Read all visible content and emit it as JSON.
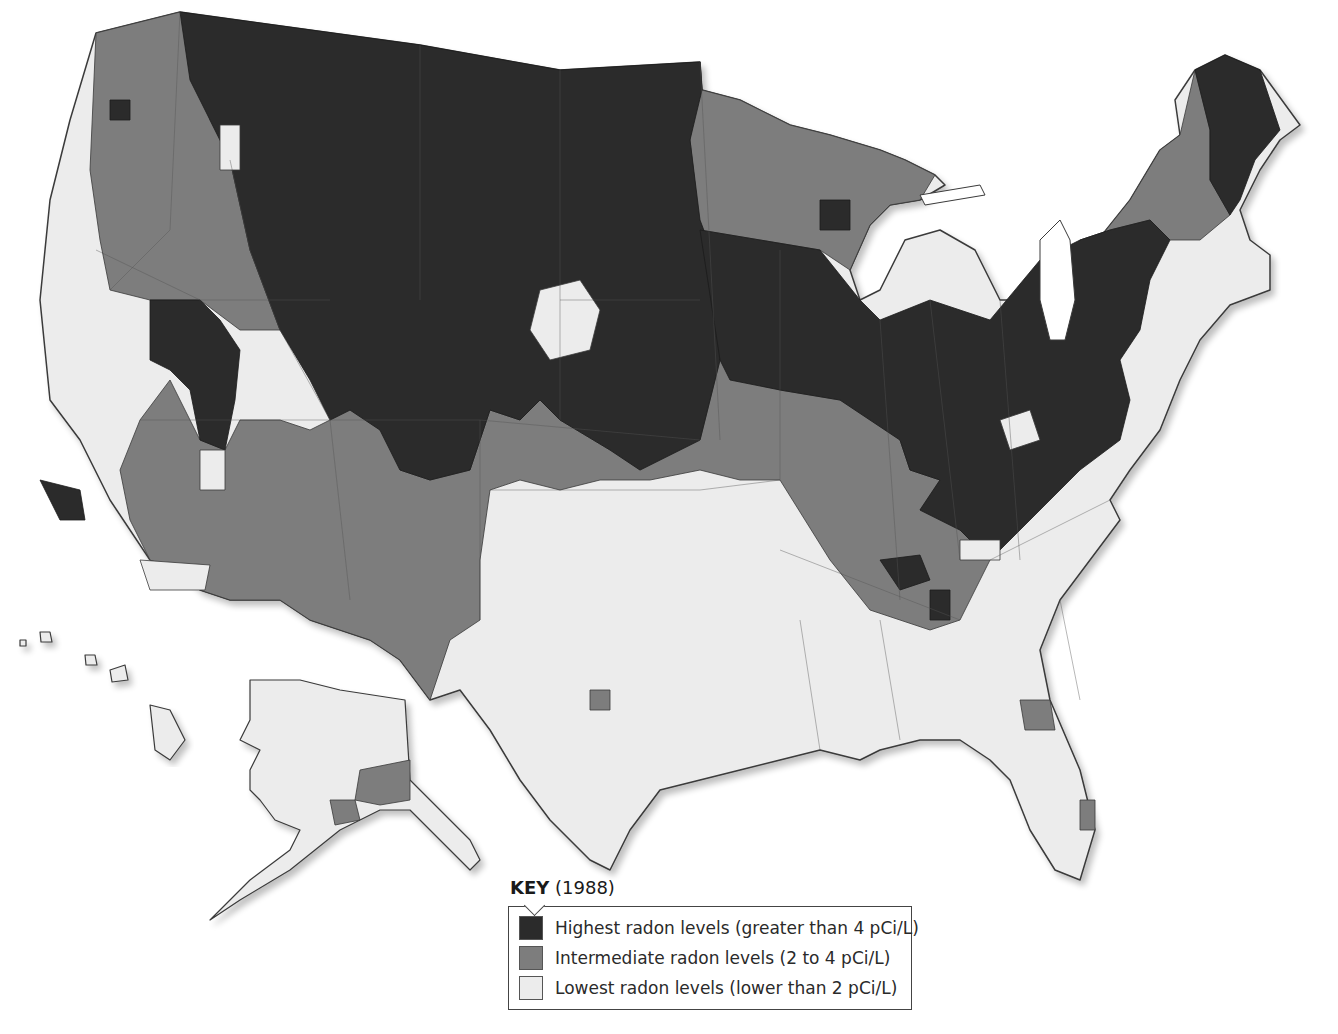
{
  "legend": {
    "title_bold": "KEY",
    "title_year": "(1988)",
    "items": [
      {
        "label": "Highest radon levels (greater than 4 pCi/L)",
        "color": "#2b2b2b"
      },
      {
        "label": "Intermediate radon levels (2 to 4 pCi/L)",
        "color": "#7d7d7d"
      },
      {
        "label": "Lowest radon levels (lower than 2 pCi/L)",
        "color": "#ececec"
      }
    ]
  },
  "colors": {
    "high": "#2b2b2b",
    "mid": "#7d7d7d",
    "low": "#ececec",
    "border": "#3a3a3a",
    "water": "#ffffff"
  },
  "map": {
    "regions": {
      "conus_outline": "96,33 180,12 420,45 560,70 700,62 702,90 740,100 790,125 830,135 880,150 905,160 935,175 945,185 920,200 890,205 870,225 850,270 860,300 880,290 905,240 940,230 975,250 1000,300 1020,300 1060,270 1090,250 1130,200 1160,150 1180,135 1175,100 1195,70 1225,55 1260,70 1300,125 1280,140 1260,170 1240,210 1250,240 1270,255 1270,290 1230,305 1200,340 1180,380 1160,430 1130,470 1110,500 1120,520 1090,560 1060,600 1040,650 1050,700 1080,770 1095,830 1080,880 1055,870 1030,830 1010,780 990,760 960,740 920,740 880,750 860,760 820,750 780,760 740,770 700,780 660,790 630,830 610,870 590,860 550,820 520,780 490,730 460,690 430,700 400,660 370,640 310,620 280,600 230,600 200,590 180,570 150,560 110,500 80,440 50,400 40,300 50,200 70,120",
      "high": [
        "180,12 420,45 560,70 700,62 702,90 690,140 700,220 730,300 720,360 700,440 640,470 610,450 560,420 540,400 520,420 490,410 470,470 430,480 400,470 380,430 350,410 330,420 310,380 280,330 250,250 230,160 210,120 190,80",
        "700,230 760,240 820,250 860,300 880,320 930,300 990,320 1040,260 1080,240 1110,230 1150,220 1170,240 1150,280 1140,330 1120,360 1130,400 1120,440 1080,470 1030,520 990,560 960,530 920,510 940,480 910,470 900,440 870,420 840,400 780,390 730,380 720,360",
        "1195,70 1225,55 1260,70 1280,130 1255,160 1240,200 1230,215 1210,180 1210,130",
        "150,300 200,300 220,320 240,350 235,400 225,450 200,440 190,390 170,370 150,360",
        "40,480 80,490 85,520 60,520",
        "880,560 920,555 930,580 900,590",
        "930,590 950,590 950,620 930,620",
        "110,100 130,100 130,120 110,120",
        "820,200 850,200 850,230 820,230"
      ],
      "mid": [
        "96,33 180,12 200,80 210,120 230,160 250,250 280,330 240,330 200,300 150,300 110,290 100,240 90,170",
        "330,420 350,410 380,430 400,470 430,480 470,470 490,410 520,420 540,400 560,420 610,450 640,470 700,440 720,360 780,390 840,400 870,420 900,440 910,470 940,480 920,510 960,530 990,560 960,620 930,630 870,610 830,560 780,480 740,480 700,470 650,480 600,480 560,490 520,480 490,490 480,560 480,620 450,640 430,700 400,660 370,640 310,620 280,600 230,600 200,590 180,570 150,560 130,520 120,470 140,420 170,380 200,440 225,450 240,420 280,420 310,430",
        "700,62 702,90 740,100 790,125 830,135 880,150 905,160 935,175 920,200 890,205 870,225 850,270 820,250 760,240 700,230 690,140",
        "1060,270 1090,250 1130,200 1160,150 1180,135 1195,70 1210,130 1210,180 1230,215 1200,240 1170,240 1150,220 1110,230 1080,240",
        "480,250 520,200 560,220 590,260 620,300 600,360 560,380 520,370 490,330",
        "380,170 420,150 440,190 420,210 390,210",
        "590,690 610,690 610,710 590,710",
        "1020,700 1050,700 1055,730 1025,730",
        "1080,800 1095,800 1095,830 1080,830"
      ],
      "low_spots": [
        "540,290 580,280 600,310 590,350 550,360 530,330",
        "200,450 225,450 225,490 200,490",
        "140,560 210,565 205,590 150,590",
        "220,125 240,125 240,170 220,170",
        "1000,420 1030,410 1040,440 1010,450",
        "960,540 1000,540 1000,560 960,560"
      ],
      "lakes": [
        "1040,240 1060,220 1070,240 1075,300 1065,340 1050,340 1040,300",
        "920,195 980,185 985,195 925,205"
      ],
      "alaska": "250,680 300,680 340,690 405,700 410,780 430,800 470,840 480,860 470,870 440,840 410,810 380,810 340,830 290,870 240,900 210,920 250,880 290,850 300,830 275,820 260,800 250,790 250,770 260,750 240,740 250,720",
      "alaska_mid": [
        "360,770 410,760 410,800 380,805 355,800",
        "330,800 355,800 360,820 335,825"
      ],
      "hawaii": [
        "150,705 170,710 185,740 170,760 155,750",
        "110,670 125,665 128,680 112,682",
        "85,655 95,655 97,665 86,665",
        "40,632 50,632 52,642 41,642",
        "20,640 26,640 26,646 20,646"
      ]
    },
    "state_lines": [
      "180,12 170,230 110,290",
      "230,160 250,250 280,330 330,420",
      "96,250 200,300 330,300",
      "140,420 330,420 480,420 700,440",
      "330,420 350,600",
      "480,420 480,620",
      "490,490 700,490 780,480",
      "560,300 700,300",
      "420,45 420,300",
      "560,70 560,420",
      "700,62 720,440",
      "780,250 780,480",
      "880,320 900,600",
      "930,300 960,560",
      "1000,300 1020,560",
      "990,560 1110,500",
      "780,550 960,620",
      "800,620 820,750",
      "880,620 900,740",
      "1060,600 1080,700"
    ]
  }
}
